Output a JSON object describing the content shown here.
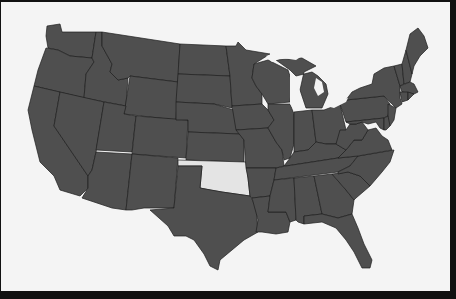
{
  "map": {
    "subject": "United States",
    "highlighted_state": "Oklahoma",
    "colors": {
      "background": "#f4f4f4",
      "frame": "#111111",
      "state_fill": "#4f4f4f",
      "state_border": "#1e1e1e",
      "highlight_fill": "#e4e4e4"
    },
    "states": [
      {
        "id": "WA",
        "name": "Washington"
      },
      {
        "id": "OR",
        "name": "Oregon"
      },
      {
        "id": "CA",
        "name": "California"
      },
      {
        "id": "ID",
        "name": "Idaho"
      },
      {
        "id": "NV",
        "name": "Nevada"
      },
      {
        "id": "MT",
        "name": "Montana"
      },
      {
        "id": "WY",
        "name": "Wyoming"
      },
      {
        "id": "UT",
        "name": "Utah"
      },
      {
        "id": "AZ",
        "name": "Arizona"
      },
      {
        "id": "CO",
        "name": "Colorado"
      },
      {
        "id": "NM",
        "name": "New Mexico"
      },
      {
        "id": "ND",
        "name": "North Dakota"
      },
      {
        "id": "SD",
        "name": "South Dakota"
      },
      {
        "id": "NE",
        "name": "Nebraska"
      },
      {
        "id": "KS",
        "name": "Kansas"
      },
      {
        "id": "OK",
        "name": "Oklahoma",
        "highlighted": true
      },
      {
        "id": "TX",
        "name": "Texas"
      },
      {
        "id": "MN",
        "name": "Minnesota"
      },
      {
        "id": "IA",
        "name": "Iowa"
      },
      {
        "id": "MO",
        "name": "Missouri"
      },
      {
        "id": "AR",
        "name": "Arkansas"
      },
      {
        "id": "LA",
        "name": "Louisiana"
      },
      {
        "id": "WI",
        "name": "Wisconsin"
      },
      {
        "id": "IL",
        "name": "Illinois"
      },
      {
        "id": "MI",
        "name": "Michigan"
      },
      {
        "id": "IN",
        "name": "Indiana"
      },
      {
        "id": "OH",
        "name": "Ohio"
      },
      {
        "id": "KY",
        "name": "Kentucky"
      },
      {
        "id": "TN",
        "name": "Tennessee"
      },
      {
        "id": "MS",
        "name": "Mississippi"
      },
      {
        "id": "AL",
        "name": "Alabama"
      },
      {
        "id": "GA",
        "name": "Georgia"
      },
      {
        "id": "FL",
        "name": "Florida"
      },
      {
        "id": "SC",
        "name": "South Carolina"
      },
      {
        "id": "NC",
        "name": "North Carolina"
      },
      {
        "id": "VA",
        "name": "Virginia"
      },
      {
        "id": "WV",
        "name": "West Virginia"
      },
      {
        "id": "PA",
        "name": "Pennsylvania"
      },
      {
        "id": "NY",
        "name": "New York"
      },
      {
        "id": "NJ",
        "name": "New Jersey"
      },
      {
        "id": "MD",
        "name": "Maryland"
      },
      {
        "id": "DE",
        "name": "Delaware"
      },
      {
        "id": "VT",
        "name": "Vermont"
      },
      {
        "id": "NH",
        "name": "New Hampshire"
      },
      {
        "id": "ME",
        "name": "Maine"
      },
      {
        "id": "MA",
        "name": "Massachusetts"
      },
      {
        "id": "CT",
        "name": "Connecticut"
      },
      {
        "id": "RI",
        "name": "Rhode Island"
      }
    ]
  }
}
